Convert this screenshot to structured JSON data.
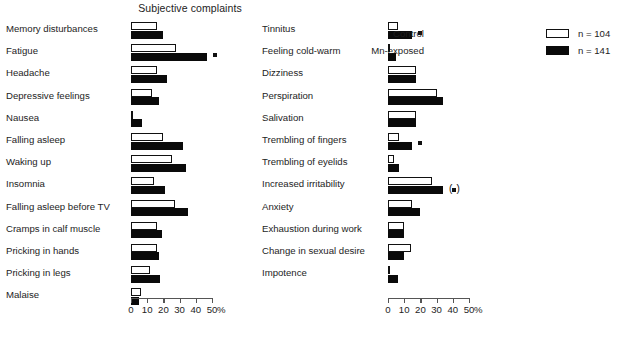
{
  "title": "Subjective complaints",
  "legend": {
    "control": {
      "label": "Control",
      "n": "n = 104"
    },
    "exposed": {
      "label": "Mn-exposed",
      "n": "n = 141"
    }
  },
  "axis": {
    "unit": "%",
    "ticks": [
      "0",
      "10",
      "20",
      "30",
      "40",
      "50"
    ],
    "min": 0,
    "max": 50
  },
  "chart_data": {
    "type": "bar",
    "title": "Subjective complaints",
    "xlabel": "%",
    "ylabel": "",
    "xlim": [
      0,
      50
    ],
    "grid": false,
    "orientation": "horizontal",
    "legend_position": "top-right",
    "series": [
      {
        "name": "Control",
        "n": 104,
        "color": "#ffffff",
        "edge": "#111111"
      },
      {
        "name": "Mn-exposed",
        "n": 141,
        "color": "#0a0a0a",
        "edge": "#0a0a0a"
      }
    ],
    "panels": [
      {
        "id": "left",
        "rows": [
          {
            "label": "Memory disturbances",
            "control": 16,
            "exposed": 20,
            "sig": ""
          },
          {
            "label": "Fatigue",
            "control": 28,
            "exposed": 47,
            "sig": "dot"
          },
          {
            "label": "Headache",
            "control": 16,
            "exposed": 22,
            "sig": ""
          },
          {
            "label": "Depressive feelings",
            "control": 13,
            "exposed": 17,
            "sig": ""
          },
          {
            "label": "Nausea",
            "control": 1,
            "exposed": 7,
            "sig": ""
          },
          {
            "label": "Falling asleep",
            "control": 20,
            "exposed": 32,
            "sig": ""
          },
          {
            "label": "Waking up",
            "control": 25,
            "exposed": 34,
            "sig": ""
          },
          {
            "label": "Insomnia",
            "control": 14,
            "exposed": 21,
            "sig": ""
          },
          {
            "label": "Falling asleep before TV",
            "control": 27,
            "exposed": 35,
            "sig": ""
          },
          {
            "label": "Cramps in calf muscle",
            "control": 16,
            "exposed": 19,
            "sig": ""
          },
          {
            "label": "Pricking in hands",
            "control": 16,
            "exposed": 17,
            "sig": ""
          },
          {
            "label": "Pricking in legs",
            "control": 12,
            "exposed": 18,
            "sig": ""
          },
          {
            "label": "Malaise",
            "control": 6,
            "exposed": 5,
            "sig": ""
          }
        ]
      },
      {
        "id": "right",
        "rows": [
          {
            "label": "Tinnitus",
            "control": 6,
            "exposed": 15,
            "sig": "dot"
          },
          {
            "label": "Feeling cold-warm",
            "control": 1,
            "exposed": 5,
            "sig": ""
          },
          {
            "label": "Dizziness",
            "control": 17,
            "exposed": 17,
            "sig": ""
          },
          {
            "label": "Perspiration",
            "control": 30,
            "exposed": 34,
            "sig": ""
          },
          {
            "label": "Salivation",
            "control": 17,
            "exposed": 17,
            "sig": ""
          },
          {
            "label": "Trembling of fingers",
            "control": 7,
            "exposed": 15,
            "sig": "dot"
          },
          {
            "label": "Trembling of eyelids",
            "control": 4,
            "exposed": 7,
            "sig": ""
          },
          {
            "label": "Increased irritability",
            "control": 27,
            "exposed": 34,
            "sig": "paren-dot"
          },
          {
            "label": "Anxiety",
            "control": 15,
            "exposed": 20,
            "sig": ""
          },
          {
            "label": "Exhaustion during work",
            "control": 10,
            "exposed": 10,
            "sig": ""
          },
          {
            "label": "Change in sexual desire",
            "control": 14,
            "exposed": 10,
            "sig": ""
          },
          {
            "label": "Impotence",
            "control": 1,
            "exposed": 6,
            "sig": ""
          }
        ]
      }
    ]
  }
}
